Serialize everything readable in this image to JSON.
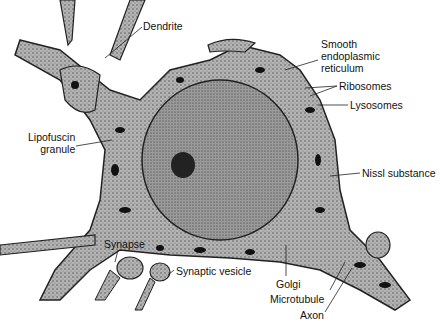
{
  "diagram": {
    "labels": [
      {
        "id": "dendrite",
        "text": "Dendrite",
        "x": 143,
        "y": 20
      },
      {
        "id": "smooth-er",
        "text": "Smooth\nendoplasmic\nreticulum",
        "x": 321,
        "y": 40
      },
      {
        "id": "ribosomes",
        "text": "Ribosomes",
        "x": 339,
        "y": 80
      },
      {
        "id": "lysosomes",
        "text": "Lysosomes",
        "x": 350,
        "y": 100
      },
      {
        "id": "lipofuscin",
        "text": "Lipofuscin\ngranule",
        "x": 28,
        "y": 132
      },
      {
        "id": "nissl",
        "text": "Nissl substance",
        "x": 362,
        "y": 167
      },
      {
        "id": "synapse",
        "text": "Synapse",
        "x": 104,
        "y": 238
      },
      {
        "id": "synaptic-vesicle",
        "text": "Synaptic vesicle",
        "x": 176,
        "y": 265
      },
      {
        "id": "golgi",
        "text": "Golgi",
        "x": 276,
        "y": 278
      },
      {
        "id": "microtubule",
        "text": "Microtubule",
        "x": 270,
        "y": 293
      },
      {
        "id": "axon",
        "text": "Axon",
        "x": 300,
        "y": 310
      }
    ],
    "colors": {
      "cytoplasm": "#a9a9a9",
      "nucleus": "#8e8e8e",
      "organelle": "#111111",
      "outline": "#222222",
      "text": "#111111"
    }
  }
}
